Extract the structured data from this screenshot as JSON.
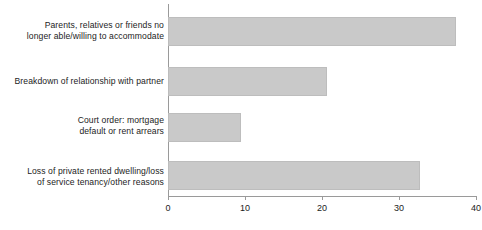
{
  "chart_data": {
    "type": "bar",
    "orientation": "horizontal",
    "title": "",
    "subtitle": "",
    "xlabel": "",
    "ylabel": "",
    "xlim": [
      0,
      40
    ],
    "grid": false,
    "legend": null,
    "bar_color": "#c9c9c9",
    "axis_color": "#9a9a9a",
    "text_color": "#1c1c1c",
    "xticks": [
      0,
      10,
      20,
      30,
      40
    ],
    "xtick_labels": [
      "0",
      "10",
      "20",
      "30",
      "40"
    ],
    "categories": [
      "Parents, relatives or friends no\nlonger able/willing to accommodate",
      "Breakdown of relationship with partner",
      "Court order: mortgage\ndefault or rent arrears",
      "Loss of private rented dwelling/loss\nof service tenancy/other reasons"
    ],
    "values": [
      37.4,
      20.6,
      9.5,
      32.7
    ]
  }
}
